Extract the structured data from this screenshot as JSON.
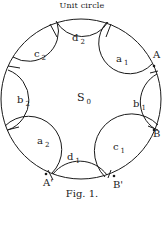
{
  "figure": {
    "title": "Unit circle",
    "caption": "Fig. 1.",
    "center_label": {
      "main": "S",
      "sub": "0"
    }
  },
  "regions": [
    {
      "id": "d2",
      "main": "d",
      "sub": "2"
    },
    {
      "id": "c2",
      "main": "c",
      "sub": "2"
    },
    {
      "id": "a1",
      "main": "a",
      "sub": "1"
    },
    {
      "id": "b2",
      "main": "b",
      "sub": "2"
    },
    {
      "id": "b1",
      "main": "b",
      "sub": "1"
    },
    {
      "id": "a2",
      "main": "a",
      "sub": "2"
    },
    {
      "id": "d1",
      "main": "d",
      "sub": "1"
    },
    {
      "id": "c1",
      "main": "c",
      "sub": "1"
    }
  ],
  "points": [
    {
      "id": "A",
      "label": "A"
    },
    {
      "id": "B",
      "label": "B"
    },
    {
      "id": "A_prime",
      "label": "A'"
    },
    {
      "id": "B_prime",
      "label": "B'"
    }
  ],
  "colors": {
    "stroke": "#1a1a1a",
    "background": "#ffffff"
  }
}
